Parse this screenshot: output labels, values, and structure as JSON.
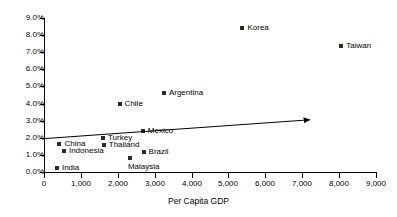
{
  "chart_data": {
    "type": "scatter",
    "title": "",
    "xlabel": "Per Capita GDP",
    "ylabel": "",
    "xlim": [
      0,
      9000
    ],
    "ylim": [
      0,
      0.09
    ],
    "grid": false,
    "legend": "none",
    "x_ticks": [
      "0",
      "1,000",
      "2,000",
      "3,000",
      "4,000",
      "5,000",
      "6,000",
      "7,000",
      "8,000",
      "9,000"
    ],
    "x_tick_values": [
      0,
      1000,
      2000,
      3000,
      4000,
      5000,
      6000,
      7000,
      8000,
      9000
    ],
    "y_ticks": [
      "0.0%",
      "1.0%",
      "2.0%",
      "3.0%",
      "4.0%",
      "5.0%",
      "6.0%",
      "7.0%",
      "8.0%",
      "9.0%"
    ],
    "y_tick_values": [
      0,
      1,
      2,
      3,
      4,
      5,
      6,
      7,
      8,
      9
    ],
    "points": [
      {
        "label": "India",
        "x": 350,
        "y": 0.25,
        "label_pos": "right"
      },
      {
        "label": "China",
        "x": 420,
        "y": 1.65,
        "label_pos": "right"
      },
      {
        "label": "Indonesia",
        "x": 540,
        "y": 1.25,
        "label_pos": "right"
      },
      {
        "label": "Turkey",
        "x": 1600,
        "y": 2.0,
        "label_pos": "right"
      },
      {
        "label": "Thailand",
        "x": 1620,
        "y": 1.6,
        "label_pos": "right"
      },
      {
        "label": "Chile",
        "x": 2050,
        "y": 3.95,
        "label_pos": "right"
      },
      {
        "label": "Malaysia",
        "x": 2330,
        "y": 0.8,
        "label_pos": "below"
      },
      {
        "label": "Mexico",
        "x": 2680,
        "y": 2.4,
        "label_pos": "right"
      },
      {
        "label": "Brazil",
        "x": 2700,
        "y": 1.15,
        "label_pos": "right"
      },
      {
        "label": "Argentina",
        "x": 3250,
        "y": 4.6,
        "label_pos": "right"
      },
      {
        "label": "Korea",
        "x": 5380,
        "y": 8.4,
        "label_pos": "right"
      },
      {
        "label": "Taiwan",
        "x": 8060,
        "y": 7.35,
        "label_pos": "right"
      }
    ],
    "annotations": [
      {
        "name": "trend-arrow",
        "type": "arrow",
        "x_start": 0,
        "y_start": 1.95,
        "x_end": 7200,
        "y_end": 3.05
      }
    ],
    "marker_color": "#2b2b2b",
    "axis_color": "#000000"
  }
}
